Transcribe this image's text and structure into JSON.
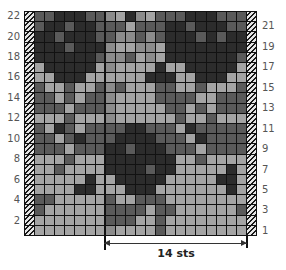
{
  "chart": {
    "columns": 21,
    "rows": 22,
    "repeat_label": "14 sts",
    "left_row_labels": [
      "22",
      "20",
      "18",
      "16",
      "14",
      "12",
      "10",
      "8",
      "6",
      "4",
      "2"
    ],
    "right_row_labels": [
      "21",
      "19",
      "17",
      "15",
      "13",
      "11",
      "9",
      "7",
      "5",
      "3",
      "1"
    ],
    "edge_stitch": "hatched",
    "palette": [
      "#a4a4a4",
      "#8c8c8c",
      "#5a5a5a",
      "#2c2c2c"
    ],
    "grid_top_to_bottom": [
      [
        2,
        2,
        3,
        3,
        3,
        2,
        2,
        1,
        0,
        3,
        1,
        0,
        2,
        2,
        2,
        3,
        3,
        3,
        2,
        2,
        2
      ],
      [
        2,
        3,
        3,
        2,
        3,
        3,
        2,
        2,
        2,
        0,
        2,
        2,
        2,
        3,
        3,
        2,
        3,
        3,
        3,
        2,
        2
      ],
      [
        3,
        3,
        2,
        3,
        3,
        3,
        2,
        2,
        1,
        1,
        2,
        1,
        2,
        3,
        3,
        3,
        2,
        3,
        2,
        3,
        3
      ],
      [
        3,
        3,
        3,
        2,
        3,
        3,
        3,
        1,
        0,
        0,
        1,
        1,
        0,
        3,
        3,
        3,
        3,
        3,
        3,
        3,
        3
      ],
      [
        3,
        3,
        3,
        3,
        3,
        3,
        2,
        1,
        1,
        2,
        0,
        1,
        0,
        3,
        3,
        3,
        3,
        3,
        3,
        3,
        2
      ],
      [
        0,
        3,
        3,
        3,
        3,
        3,
        0,
        1,
        0,
        0,
        0,
        0,
        3,
        0,
        0,
        3,
        3,
        3,
        3,
        3,
        0
      ],
      [
        0,
        0,
        3,
        3,
        3,
        0,
        0,
        0,
        0,
        0,
        0,
        3,
        3,
        3,
        0,
        0,
        3,
        3,
        3,
        0,
        0
      ],
      [
        2,
        0,
        0,
        2,
        0,
        0,
        2,
        1,
        2,
        0,
        0,
        0,
        2,
        2,
        0,
        0,
        2,
        0,
        0,
        0,
        2
      ],
      [
        2,
        2,
        0,
        2,
        0,
        2,
        2,
        1,
        0,
        0,
        0,
        0,
        2,
        2,
        2,
        2,
        0,
        0,
        2,
        2,
        2
      ],
      [
        2,
        2,
        2,
        0,
        2,
        2,
        2,
        1,
        0,
        0,
        0,
        0,
        0,
        2,
        2,
        0,
        2,
        0,
        2,
        2,
        2
      ],
      [
        0,
        0,
        0,
        2,
        0,
        0,
        0,
        1,
        0,
        0,
        0,
        0,
        0,
        0,
        2,
        0,
        0,
        2,
        0,
        0,
        0
      ],
      [
        2,
        0,
        3,
        2,
        0,
        2,
        2,
        2,
        2,
        3,
        3,
        2,
        2,
        2,
        0,
        3,
        2,
        2,
        2,
        2,
        2
      ],
      [
        2,
        2,
        0,
        2,
        3,
        2,
        2,
        2,
        3,
        3,
        3,
        3,
        2,
        2,
        2,
        0,
        3,
        2,
        2,
        2,
        2
      ],
      [
        2,
        2,
        2,
        0,
        2,
        2,
        2,
        3,
        3,
        2,
        3,
        3,
        3,
        2,
        2,
        2,
        0,
        2,
        2,
        2,
        2
      ],
      [
        0,
        0,
        0,
        2,
        0,
        0,
        0,
        3,
        3,
        3,
        3,
        3,
        3,
        3,
        0,
        0,
        2,
        0,
        0,
        0,
        0
      ],
      [
        0,
        0,
        2,
        0,
        0,
        0,
        0,
        3,
        3,
        3,
        3,
        2,
        3,
        3,
        0,
        0,
        0,
        0,
        0,
        3,
        0
      ],
      [
        0,
        0,
        0,
        0,
        0,
        3,
        0,
        0,
        3,
        3,
        3,
        3,
        3,
        0,
        0,
        0,
        0,
        0,
        3,
        3,
        0
      ],
      [
        0,
        0,
        0,
        0,
        3,
        3,
        0,
        0,
        0,
        3,
        3,
        3,
        0,
        0,
        0,
        0,
        0,
        0,
        0,
        3,
        0
      ],
      [
        2,
        2,
        0,
        0,
        0,
        0,
        0,
        2,
        0,
        0,
        2,
        2,
        2,
        0,
        0,
        0,
        0,
        0,
        0,
        0,
        0
      ],
      [
        2,
        0,
        0,
        0,
        0,
        0,
        0,
        2,
        2,
        2,
        2,
        0,
        2,
        2,
        0,
        0,
        0,
        0,
        0,
        0,
        2
      ],
      [
        0,
        0,
        0,
        0,
        0,
        0,
        0,
        2,
        2,
        2,
        0,
        0,
        2,
        0,
        0,
        0,
        0,
        0,
        0,
        0,
        0
      ],
      [
        0,
        0,
        0,
        0,
        0,
        0,
        0,
        1,
        0,
        0,
        0,
        0,
        2,
        0,
        0,
        0,
        0,
        0,
        0,
        0,
        0
      ]
    ]
  }
}
